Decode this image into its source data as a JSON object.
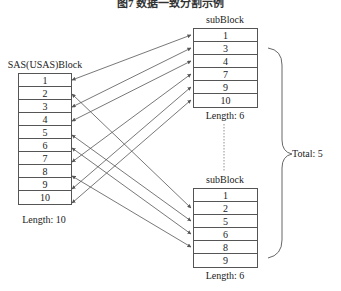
{
  "caption": "图7 数据一致分割示例",
  "source_block": {
    "title": "SAS(USAS)Block",
    "cells": [
      "1",
      "2",
      "3",
      "4",
      "5",
      "6",
      "7",
      "8",
      "9",
      "10"
    ],
    "length_label": "Length: 10"
  },
  "sub_blocks": [
    {
      "title": "subBlock",
      "cells": [
        "1",
        "3",
        "4",
        "7",
        "9",
        "10"
      ],
      "length_label": "Length: 6",
      "linked_source_rows": [
        1,
        3,
        4,
        7,
        9,
        10
      ]
    },
    {
      "title": "subBlock",
      "cells": [
        "1",
        "2",
        "5",
        "6",
        "8",
        "9"
      ],
      "length_label": "Length: 6",
      "linked_source_rows": [
        2,
        5,
        6,
        8
      ]
    }
  ],
  "total_label": "Total: 5",
  "colors": {
    "line": "#555555",
    "text": "#222222",
    "background": "#ffffff"
  }
}
